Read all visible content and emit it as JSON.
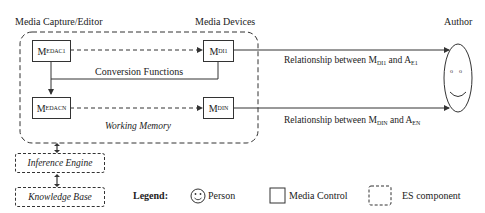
{
  "diagram": {
    "headers": {
      "capture_editor": "Media Capture/Editor",
      "media_devices": "Media Devices",
      "author": "Author"
    },
    "nodes": {
      "edac1": {
        "base": "M",
        "sub": "EDAC1"
      },
      "edacn": {
        "base": "M",
        "sub": "EDACN"
      },
      "di1": {
        "base": "M",
        "sub": "DI1"
      },
      "din": {
        "base": "M",
        "sub": "DIN"
      }
    },
    "conversion_functions": "Conversion Functions",
    "working_memory": "Working Memory",
    "inference_engine": "Inference Engine",
    "knowledge_base": "Knowledge Base",
    "relationships": [
      {
        "prefix": "Relationship between M",
        "m_sub": "DI1",
        "mid": " and A",
        "a_sub": "E1"
      },
      {
        "prefix": "Relationship between M",
        "m_sub": "DIN",
        "mid": " and A",
        "a_sub": "EN"
      }
    ],
    "legend": {
      "title": "Legend:",
      "items": [
        {
          "icon": "person-smiley-icon",
          "label": "Person"
        },
        {
          "icon": "solid-box-icon",
          "label": "Media Control"
        },
        {
          "icon": "dashed-box-icon",
          "label": "ES component"
        }
      ]
    },
    "colors": {
      "stroke": "#333333",
      "background": "#ffffff"
    }
  }
}
